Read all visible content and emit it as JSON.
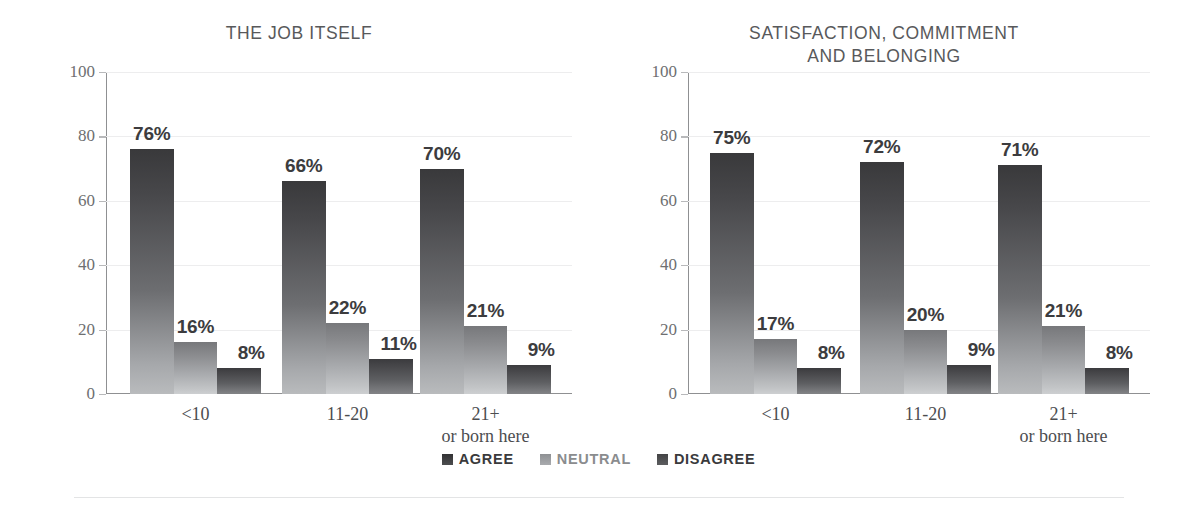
{
  "page": {
    "background": "#ffffff",
    "bottom_rule_color": "#e3e4e5"
  },
  "legend": {
    "items": [
      {
        "label": "AGREE",
        "color": "#3f3f42",
        "icon": "square-swatch-icon"
      },
      {
        "label": "NEUTRAL",
        "color": "#9b9d9f",
        "icon": "square-swatch-icon"
      },
      {
        "label": "DISAGREE",
        "color": "#4d4e50",
        "icon": "square-swatch-icon"
      }
    ]
  },
  "charts": [
    {
      "title": "THE JOB ITSELF",
      "yticks": [
        "0",
        "20",
        "40",
        "60",
        "80",
        "100"
      ],
      "categories": [
        "<10",
        "11-20",
        "21+\nor born here"
      ],
      "bars": [
        {
          "label": "76%",
          "value": 76
        },
        {
          "label": "16%",
          "value": 16
        },
        {
          "label": "8%",
          "value": 8
        },
        {
          "label": "66%",
          "value": 66
        },
        {
          "label": "22%",
          "value": 22
        },
        {
          "label": "11%",
          "value": 11
        },
        {
          "label": "70%",
          "value": 70
        },
        {
          "label": "21%",
          "value": 21
        },
        {
          "label": "9%",
          "value": 9
        }
      ]
    },
    {
      "title": "SATISFACTION, COMMITMENT\nAND BELONGING",
      "yticks": [
        "0",
        "20",
        "40",
        "60",
        "80",
        "100"
      ],
      "categories": [
        "<10",
        "11-20",
        "21+\nor born here"
      ],
      "bars": [
        {
          "label": "75%",
          "value": 75
        },
        {
          "label": "17%",
          "value": 17
        },
        {
          "label": "8%",
          "value": 8
        },
        {
          "label": "72%",
          "value": 72
        },
        {
          "label": "20%",
          "value": 20
        },
        {
          "label": "9%",
          "value": 9
        },
        {
          "label": "71%",
          "value": 71
        },
        {
          "label": "21%",
          "value": 21
        },
        {
          "label": "8%",
          "value": 8
        }
      ]
    }
  ],
  "chart_data": [
    {
      "type": "bar",
      "title": "THE JOB ITSELF",
      "xlabel": "",
      "ylabel": "",
      "ylim": [
        0,
        100
      ],
      "yticks": [
        0,
        20,
        40,
        60,
        80,
        100
      ],
      "grid": true,
      "legend_position": "bottom-center-shared",
      "categories": [
        "<10",
        "11-20",
        "21+ or born here"
      ],
      "series": [
        {
          "name": "AGREE",
          "values": [
            76,
            66,
            70
          ],
          "labels": [
            "76%",
            "66%",
            "70%"
          ],
          "color": "#3f3f42"
        },
        {
          "name": "NEUTRAL",
          "values": [
            16,
            22,
            21
          ],
          "labels": [
            "16%",
            "22%",
            "21%"
          ],
          "color": "#9b9d9f"
        },
        {
          "name": "DISAGREE",
          "values": [
            8,
            11,
            9
          ],
          "labels": [
            "8%",
            "11%",
            "9%"
          ],
          "color": "#4d4e50"
        }
      ]
    },
    {
      "type": "bar",
      "title": "SATISFACTION, COMMITMENT AND BELONGING",
      "xlabel": "",
      "ylabel": "",
      "ylim": [
        0,
        100
      ],
      "yticks": [
        0,
        20,
        40,
        60,
        80,
        100
      ],
      "grid": true,
      "legend_position": "bottom-center-shared",
      "categories": [
        "<10",
        "11-20",
        "21+ or born here"
      ],
      "series": [
        {
          "name": "AGREE",
          "values": [
            75,
            72,
            71
          ],
          "labels": [
            "75%",
            "72%",
            "71%"
          ],
          "color": "#3f3f42"
        },
        {
          "name": "NEUTRAL",
          "values": [
            17,
            20,
            21
          ],
          "labels": [
            "17%",
            "20%",
            "21%"
          ],
          "color": "#9b9d9f"
        },
        {
          "name": "DISAGREE",
          "values": [
            8,
            9,
            8
          ],
          "labels": [
            "8%",
            "9%",
            "8%"
          ],
          "color": "#4d4e50"
        }
      ]
    }
  ]
}
